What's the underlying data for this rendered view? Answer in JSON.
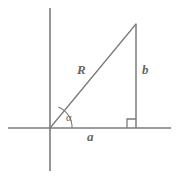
{
  "figure": {
    "name": "right-triangle-trigonometry-diagram",
    "type": "geometry-diagram",
    "background_color": "#ffffff",
    "line_color": "#7b7b7b",
    "label_color": "#666666",
    "axes": {
      "x_axis": {
        "name": "horizontal-axis",
        "x1": 8,
        "y1": 128,
        "x2": 171,
        "y2": 128
      },
      "y_axis": {
        "name": "vertical-axis",
        "x1": 50,
        "y1": 8,
        "x2": 50,
        "y2": 171
      },
      "origin": {
        "x": 50,
        "y": 128
      }
    },
    "triangle": {
      "vertices": {
        "origin": {
          "x": 50,
          "y": 128
        },
        "apex": {
          "x": 136,
          "y": 24
        },
        "foot": {
          "x": 136,
          "y": 128
        }
      },
      "hypotenuse": {
        "name": "hypotenuse-R",
        "x1": 50,
        "y1": 128,
        "x2": 136,
        "y2": 24
      },
      "vertical_leg": {
        "name": "opposite-side-b",
        "x1": 136,
        "y1": 24,
        "x2": 136,
        "y2": 128
      },
      "horizontal_leg": {
        "name": "adjacent-side-a",
        "x1": 50,
        "y1": 128,
        "x2": 136,
        "y2": 128
      }
    },
    "angle_arc": {
      "name": "alpha-angle-arc",
      "center_x": 50,
      "center_y": 128,
      "radius": 22,
      "start_x": 58,
      "start_y": 107,
      "end_x": 72,
      "end_y": 128
    },
    "right_angle_marker": {
      "name": "right-angle-square",
      "x": 127,
      "y": 119,
      "size": 9
    },
    "labels": {
      "hypotenuse": "R",
      "vertical_leg": "b",
      "horizontal_leg": "a",
      "angle": "α"
    }
  }
}
